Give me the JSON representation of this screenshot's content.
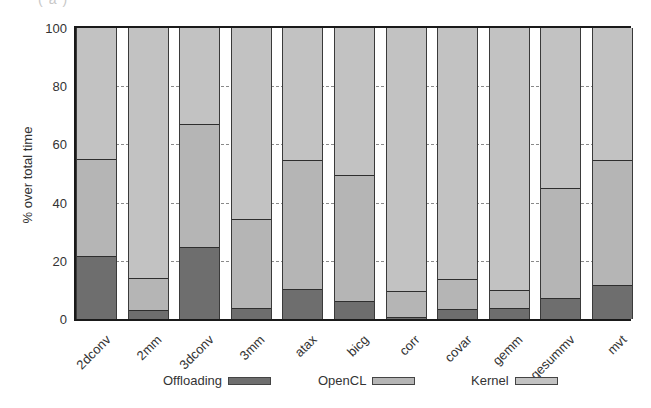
{
  "corner_label": "(a)",
  "chart_data": {
    "type": "bar",
    "stacked": true,
    "title": "",
    "xlabel": "",
    "ylabel": "% over total time",
    "ylim": [
      0,
      100
    ],
    "yticks": [
      0,
      20,
      40,
      60,
      80,
      100
    ],
    "grid": "horizontal dashed (visible in gaps between bars)",
    "legend_position": "bottom",
    "categories": [
      "2dconv",
      "2mm",
      "3dconv",
      "3mm",
      "atax",
      "bicg",
      "corr",
      "covar",
      "gemm",
      "gesummv",
      "mvt"
    ],
    "series": [
      {
        "name": "Offloading",
        "color": "#6e6e6e",
        "values": [
          21.4,
          2.7,
          24.4,
          3.4,
          9.8,
          5.8,
          0.3,
          3.0,
          3.4,
          6.8,
          11.5
        ]
      },
      {
        "name": "OpenCL",
        "color": "#b5b5b5",
        "values": [
          33.2,
          11.2,
          42.4,
          30.5,
          44.4,
          43.4,
          8.9,
          10.5,
          6.4,
          37.9,
          42.7
        ]
      },
      {
        "name": "Kernel",
        "color": "#c2c2c2",
        "values": [
          45.4,
          86.1,
          33.2,
          66.1,
          45.8,
          50.8,
          90.8,
          86.5,
          90.2,
          55.3,
          45.8
        ]
      }
    ]
  },
  "legend": [
    {
      "label": "Offloading",
      "color": "#6e6e6e"
    },
    {
      "label": "OpenCL",
      "color": "#b5b5b5"
    },
    {
      "label": "Kernel",
      "color": "#c2c2c2"
    }
  ]
}
